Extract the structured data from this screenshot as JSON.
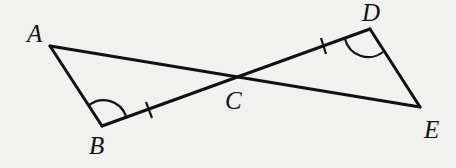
{
  "diagram": {
    "type": "geometry",
    "points": {
      "A": {
        "label": "A",
        "x": 50,
        "y": 46
      },
      "B": {
        "label": "B",
        "x": 102,
        "y": 126
      },
      "C": {
        "label": "C",
        "x": 236,
        "y": 77
      },
      "D": {
        "label": "D",
        "x": 370,
        "y": 29
      },
      "E": {
        "label": "E",
        "x": 420,
        "y": 107
      }
    },
    "segments": [
      "AB",
      "AE",
      "BD",
      "DE"
    ],
    "markings": {
      "congruent_segments": [
        "BC",
        "CD"
      ],
      "congruent_angles": [
        "B",
        "D"
      ]
    }
  }
}
